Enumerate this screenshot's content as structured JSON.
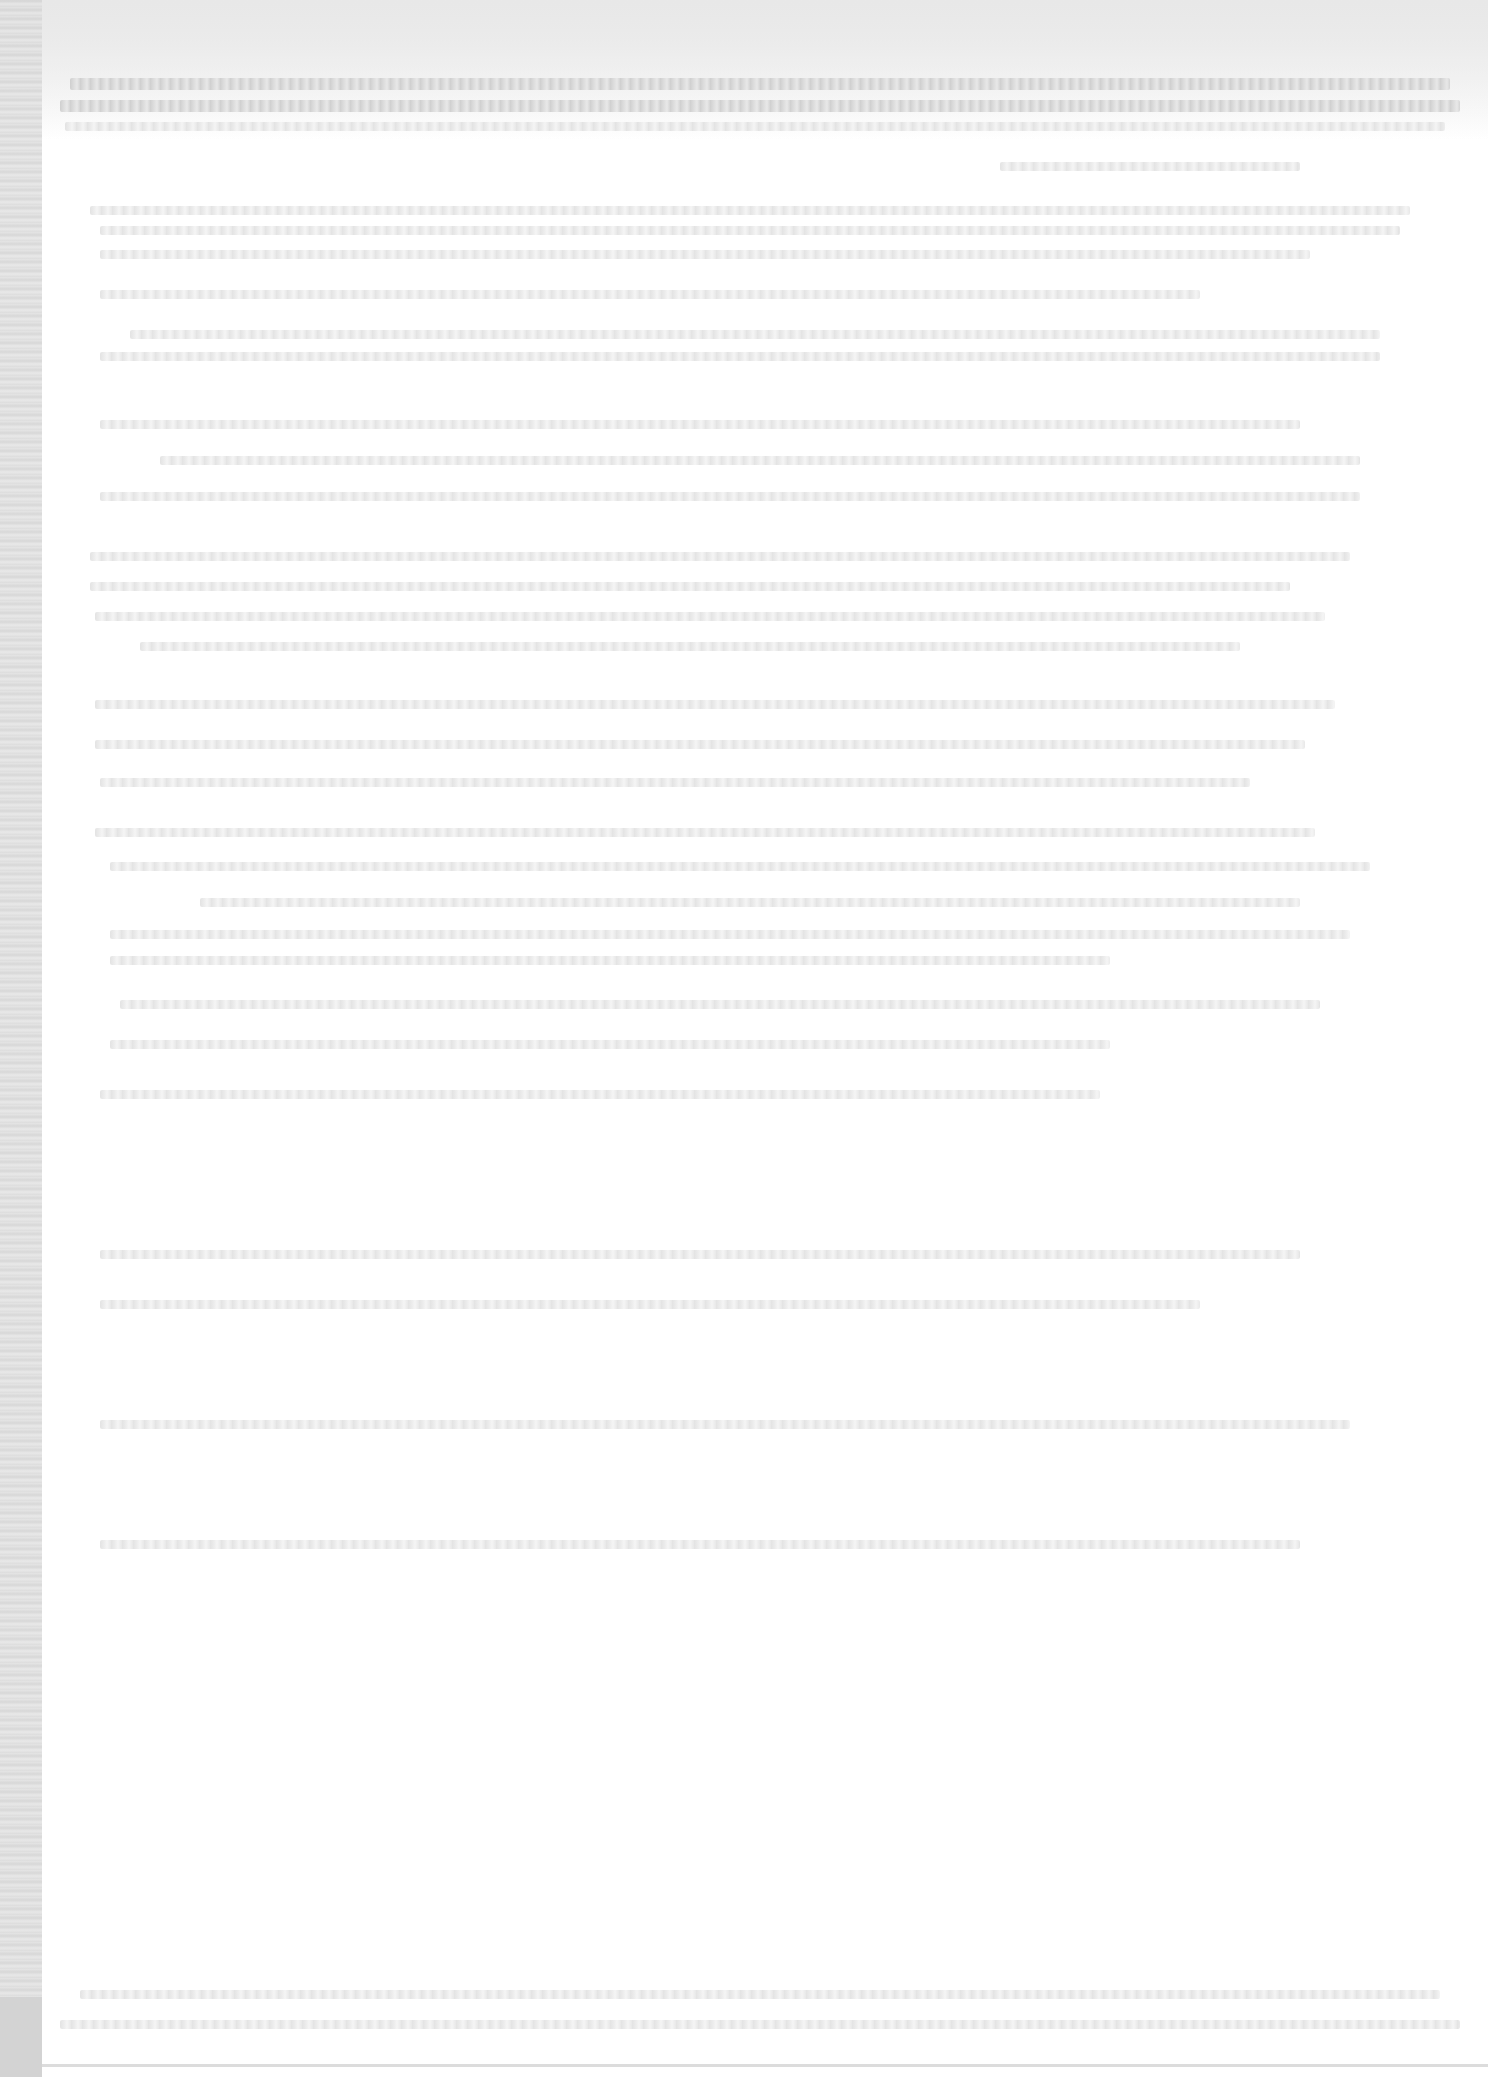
{
  "document": {
    "type": "scanned-page",
    "legibility": "illegible",
    "colors": {
      "paper": "#ffffff",
      "scan_edge": "#d9d9d9",
      "faded_text": "#e0e0e0"
    },
    "text_blocks": [
      {
        "id": "header-line-1",
        "text": ""
      },
      {
        "id": "header-line-2",
        "text": ""
      },
      {
        "id": "header-line-3",
        "text": ""
      },
      {
        "id": "para-1",
        "text": ""
      },
      {
        "id": "para-2",
        "text": ""
      },
      {
        "id": "para-3",
        "text": ""
      },
      {
        "id": "para-4",
        "text": ""
      },
      {
        "id": "para-5",
        "text": ""
      },
      {
        "id": "para-6",
        "text": ""
      },
      {
        "id": "para-7",
        "text": ""
      }
    ]
  }
}
